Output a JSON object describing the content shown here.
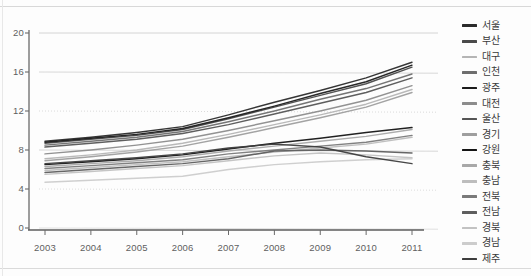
{
  "chart_data": {
    "type": "line",
    "title": "",
    "xlabel": "",
    "ylabel": "",
    "categories": [
      "2003",
      "2004",
      "2005",
      "2006",
      "2007",
      "2008",
      "2009",
      "2010",
      "2011"
    ],
    "x": [
      2003,
      2004,
      2005,
      2006,
      2007,
      2008,
      2009,
      2010,
      2011
    ],
    "ylim": [
      0,
      20
    ],
    "yticks": [
      0,
      4,
      8,
      12,
      16,
      20
    ],
    "ytick_labels": [
      "0",
      "4",
      "8",
      "12",
      "16",
      "20"
    ],
    "grid": true,
    "legend_position": "right",
    "series": [
      {
        "name": "서울",
        "color": "#2b2b2b",
        "values": [
          8.9,
          9.3,
          9.8,
          10.4,
          11.6,
          12.9,
          14.1,
          15.4,
          17.0
        ]
      },
      {
        "name": "부산",
        "color": "#4a4a4a",
        "values": [
          8.7,
          9.1,
          9.5,
          10.1,
          11.2,
          12.4,
          13.6,
          14.8,
          16.5
        ]
      },
      {
        "name": "대구",
        "color": "#b5b5b5",
        "values": [
          7.1,
          7.5,
          8.0,
          8.7,
          9.6,
          10.6,
          11.6,
          12.7,
          14.2
        ]
      },
      {
        "name": "인천",
        "color": "#6e6e6e",
        "values": [
          8.5,
          8.9,
          9.3,
          9.9,
          10.9,
          12.0,
          13.2,
          14.3,
          15.8
        ]
      },
      {
        "name": "광주",
        "color": "#1c1c1c",
        "values": [
          8.8,
          9.2,
          9.6,
          10.2,
          11.3,
          12.5,
          13.8,
          15.0,
          16.7
        ]
      },
      {
        "name": "대전",
        "color": "#8c8c8c",
        "values": [
          7.6,
          8.0,
          8.5,
          9.1,
          10.0,
          11.0,
          12.0,
          13.1,
          14.6
        ]
      },
      {
        "name": "울산",
        "color": "#555555",
        "values": [
          8.3,
          8.7,
          9.1,
          9.7,
          10.6,
          11.7,
          12.8,
          13.9,
          15.4
        ]
      },
      {
        "name": "경기",
        "color": "#9e9e9e",
        "values": [
          6.9,
          7.3,
          7.8,
          8.4,
          9.3,
          10.3,
          11.3,
          12.4,
          13.9
        ]
      },
      {
        "name": "강원",
        "color": "#151515",
        "values": [
          6.5,
          6.8,
          7.1,
          7.5,
          8.1,
          8.7,
          9.2,
          9.8,
          10.3
        ]
      },
      {
        "name": "충북",
        "color": "#a8a8a8",
        "values": [
          6.3,
          6.6,
          6.9,
          7.3,
          7.9,
          8.4,
          8.9,
          9.4,
          10.1
        ]
      },
      {
        "name": "충남",
        "color": "#bdbdbd",
        "values": [
          5.9,
          6.2,
          6.5,
          6.8,
          7.3,
          7.8,
          8.2,
          8.6,
          9.3
        ]
      },
      {
        "name": "전북",
        "color": "#7a7a7a",
        "values": [
          6.1,
          6.4,
          6.7,
          7.0,
          7.6,
          8.0,
          8.4,
          8.8,
          9.5
        ]
      },
      {
        "name": "전남",
        "color": "#5e5e5e",
        "values": [
          5.7,
          6.0,
          6.3,
          6.6,
          7.1,
          7.9,
          8.0,
          7.9,
          7.7
        ]
      },
      {
        "name": "경북",
        "color": "#c2c2c2",
        "values": [
          5.5,
          5.8,
          6.1,
          6.4,
          6.9,
          7.4,
          7.7,
          7.5,
          7.2
        ]
      },
      {
        "name": "경남",
        "color": "#cccccc",
        "values": [
          4.7,
          4.9,
          5.1,
          5.3,
          6.0,
          6.5,
          6.8,
          7.0,
          7.1
        ]
      },
      {
        "name": "제주",
        "color": "#3d3d3d",
        "values": [
          6.6,
          6.9,
          7.2,
          7.6,
          8.2,
          8.6,
          8.3,
          7.3,
          6.6
        ]
      }
    ]
  },
  "axis": {
    "y_label_0": "0",
    "y_label_4": "4",
    "y_label_8": "8",
    "y_label_12": "12",
    "y_label_16": "16",
    "y_label_20": "20"
  }
}
